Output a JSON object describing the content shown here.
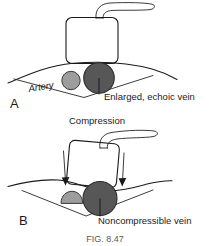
{
  "figure": {
    "caption": "FIG. 8.47",
    "background_color": "#ffffff",
    "ink_color": "#1a1a1a"
  },
  "panels": [
    {
      "letter": "A",
      "description_labels": {
        "artery": "Artery",
        "vein": "Enlarged, echoic vein"
      },
      "vessels": {
        "artery": {
          "label": "Artery",
          "shape": "circle",
          "fill_color": "#9d9d9d",
          "outline_color": "#3a3a3a",
          "state": "round"
        },
        "vein": {
          "label": "Enlarged, echoic vein",
          "shape": "circle",
          "fill_color": "#575757",
          "outline_color": "#2b2b2b",
          "state": "round-enlarged"
        }
      },
      "transducer": {
        "name": "ultrasound-transducer",
        "orientation": "upright",
        "fill_color": "#ffffff"
      }
    },
    {
      "letter": "B",
      "description_labels": {
        "compression": "Compression",
        "vein": "Noncompressible vein"
      },
      "vessels": {
        "artery": {
          "label": "",
          "shape": "half-moon",
          "fill_color": "#9d9d9d",
          "outline_color": "#3a3a3a",
          "state": "compressed"
        },
        "vein": {
          "label": "Noncompressible vein",
          "shape": "circle",
          "fill_color": "#575757",
          "outline_color": "#2b2b2b",
          "state": "round-noncompressible"
        }
      },
      "transducer": {
        "name": "ultrasound-transducer",
        "orientation": "tilted-pressing",
        "fill_color": "#ffffff"
      },
      "arrows": {
        "count": 2,
        "direction": "down",
        "meaning": "Compression"
      }
    }
  ]
}
